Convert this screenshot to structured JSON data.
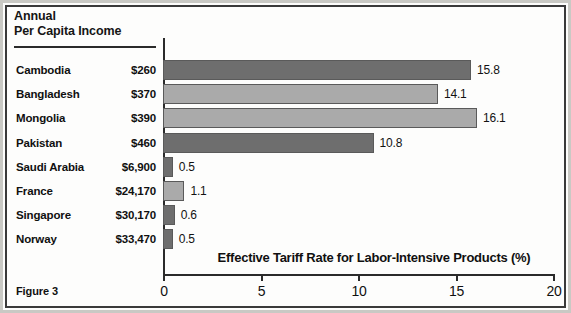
{
  "figure": {
    "caption": "Figure 3",
    "header_line1": "Annual",
    "header_line2": "Per Capita Income"
  },
  "chart_data": {
    "type": "bar",
    "orientation": "horizontal",
    "title": "",
    "xlabel": "Effective Tariff Rate for Labor-Intensive Products (%)",
    "ylabel": "",
    "xlim": [
      0,
      20
    ],
    "xticks": [
      0,
      5,
      10,
      15,
      20
    ],
    "xticklabels": [
      "0",
      "5",
      "10",
      "15",
      "20"
    ],
    "grid": false,
    "legend": "none",
    "categories": [
      "Cambodia",
      "Bangladesh",
      "Mongolia",
      "Pakistan",
      "Saudi Arabia",
      "France",
      "Singapore",
      "Norway"
    ],
    "values": [
      15.8,
      14.1,
      16.1,
      10.8,
      0.5,
      1.1,
      0.6,
      0.5
    ],
    "value_labels": [
      "15.8",
      "14.1",
      "16.1",
      "10.8",
      "0.5",
      "1.1",
      "0.6",
      "0.5"
    ],
    "annotations": {
      "series_name": "Annual Per Capita Income",
      "income_labels": [
        "$260",
        "$370",
        "$390",
        "$460",
        "$6,900",
        "$24,170",
        "$30,170",
        "$33,470"
      ]
    },
    "bar_shades": [
      "dark",
      "light",
      "light",
      "dark",
      "dark",
      "light",
      "dark",
      "dark"
    ],
    "colors": {
      "bar_dark": "#6e6e6e",
      "bar_light": "#aaaaaa",
      "axis": "#2b2b2b",
      "text": "#101010",
      "background": "#fdfdfc"
    }
  },
  "rows": [
    {
      "country": "Cambodia",
      "income": "$260",
      "value": "15.8"
    },
    {
      "country": "Bangladesh",
      "income": "$370",
      "value": "14.1"
    },
    {
      "country": "Mongolia",
      "income": "$390",
      "value": "16.1"
    },
    {
      "country": "Pakistan",
      "income": "$460",
      "value": "10.8"
    },
    {
      "country": "Saudi Arabia",
      "income": "$6,900",
      "value": "0.5"
    },
    {
      "country": "France",
      "income": "$24,170",
      "value": "1.1"
    },
    {
      "country": "Singapore",
      "income": "$30,170",
      "value": "0.6"
    },
    {
      "country": "Norway",
      "income": "$33,470",
      "value": "0.5"
    }
  ]
}
